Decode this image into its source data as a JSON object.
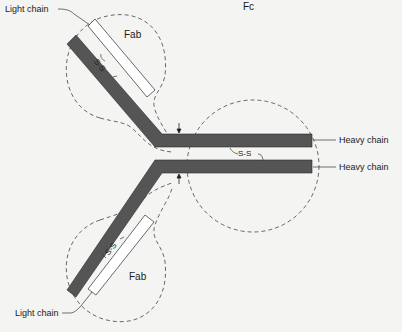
{
  "diagram": {
    "regions": {
      "fab_top": "Fab",
      "fab_bottom": "Fab",
      "fc": "Fc"
    },
    "chains": {
      "light_top": "Light chain",
      "light_bottom": "Light chain",
      "heavy_top": "Heavy chain",
      "heavy_bottom": "Heavy chain"
    },
    "bonds": {
      "ss_top": "S-S",
      "ss_middle": "S-S",
      "ss_bottom": "S-S"
    },
    "colors": {
      "heavy_chain_fill": "#555555",
      "light_chain_fill": "#ffffff",
      "outline": "#2a2a2a",
      "dashed_region": "#444444",
      "background": "#f4f4f2"
    }
  }
}
